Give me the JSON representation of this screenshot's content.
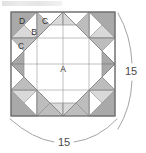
{
  "diagram": {
    "type": "quilt-block-pattern",
    "block": {
      "x": 11,
      "y": 12,
      "size": 104,
      "grid": 4
    },
    "colors": {
      "dark": "#a9a9a9",
      "medium": "#bdbdbd",
      "light": "#d9d9d9",
      "white": "#ffffff",
      "outline": "#6e6e6e",
      "thin_outline": "#8c8c8c",
      "text": "#333333",
      "dim_text": "#4a4a4a",
      "dim_line": "#9a9a9a"
    },
    "piece_labels": [
      {
        "id": "A",
        "text": "A",
        "x": 63,
        "y": 70,
        "note": "center octagon"
      },
      {
        "id": "B",
        "text": "B",
        "x": 34,
        "y": 33,
        "note": "corner inner triangle"
      },
      {
        "id": "C1",
        "text": "C",
        "x": 45,
        "y": 22,
        "note": "small triangle upper"
      },
      {
        "id": "C2",
        "text": "C",
        "x": 21,
        "y": 47,
        "note": "small triangle lower"
      },
      {
        "id": "D",
        "text": "D",
        "x": 22,
        "y": 22,
        "note": "corner large triangle"
      }
    ],
    "dimensions": [
      {
        "id": "right",
        "value": "15",
        "x": 131,
        "y": 72,
        "orientation": "vertical"
      },
      {
        "id": "bottom",
        "value": "15",
        "x": 64,
        "y": 143,
        "orientation": "horizontal"
      }
    ]
  }
}
